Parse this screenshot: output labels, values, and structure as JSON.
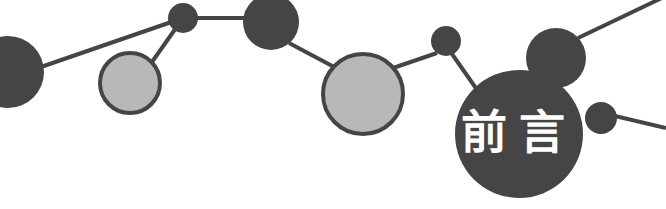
{
  "banner": {
    "title_text": "前言",
    "title_meaning": "Preface",
    "width": 666,
    "height": 209,
    "background_color": "#ffffff",
    "colors": {
      "dark_fill": "#454545",
      "light_fill": "#b8b8b8",
      "light_stroke": "#454545",
      "line_color": "#454545",
      "label_color": "#ffffff"
    },
    "graphic_type": "node-link-network-decoration",
    "nodes": [
      {
        "id": "node-1",
        "name": "dark-circle-far-left",
        "cx": 8,
        "cy": 72,
        "r": 36,
        "style": "dark",
        "label": ""
      },
      {
        "id": "node-2",
        "name": "light-circle-left",
        "cx": 130,
        "cy": 83,
        "r": 30,
        "style": "light",
        "label": ""
      },
      {
        "id": "node-3",
        "name": "small-dark-circle-top-left",
        "cx": 183,
        "cy": 18,
        "r": 15,
        "style": "dark",
        "label": ""
      },
      {
        "id": "node-4",
        "name": "dark-circle-upper-mid",
        "cx": 271,
        "cy": 22,
        "r": 28,
        "style": "dark",
        "label": ""
      },
      {
        "id": "node-5",
        "name": "light-circle-center",
        "cx": 363,
        "cy": 94,
        "r": 40,
        "style": "light",
        "label": ""
      },
      {
        "id": "node-6",
        "name": "small-dark-circle-mid-right",
        "cx": 446,
        "cy": 41,
        "r": 15,
        "style": "dark",
        "label": ""
      },
      {
        "id": "node-7",
        "name": "title-circle",
        "cx": 519,
        "cy": 134,
        "r": 64,
        "style": "dark",
        "label": "前言"
      },
      {
        "id": "node-8",
        "name": "dark-circle-top-right",
        "cx": 556,
        "cy": 58,
        "r": 30,
        "style": "dark",
        "label": ""
      },
      {
        "id": "node-9",
        "name": "small-dark-circle-bottom-right",
        "cx": 601,
        "cy": 118,
        "r": 16,
        "style": "dark",
        "label": ""
      }
    ],
    "links": [
      {
        "name": "link-node1-node3",
        "x1": 38,
        "y1": 68,
        "x2": 183,
        "y2": 18
      },
      {
        "name": "link-node3-node2",
        "x1": 183,
        "y1": 18,
        "x2": 152,
        "y2": 62
      },
      {
        "name": "link-node3-node4",
        "x1": 183,
        "y1": 18,
        "x2": 245,
        "y2": 18
      },
      {
        "name": "link-node4-node5",
        "x1": 289,
        "y1": 43,
        "x2": 336,
        "y2": 68
      },
      {
        "name": "link-node5-node6",
        "x1": 393,
        "y1": 68,
        "x2": 437,
        "y2": 53
      },
      {
        "name": "link-node6-node7",
        "x1": 452,
        "y1": 54,
        "x2": 480,
        "y2": 94
      },
      {
        "name": "link-node8-topright",
        "x1": 578,
        "y1": 38,
        "x2": 666,
        "y2": -4
      },
      {
        "name": "link-node9-right-edge",
        "x1": 615,
        "y1": 116,
        "x2": 666,
        "y2": 128
      }
    ],
    "line_width": 4
  }
}
